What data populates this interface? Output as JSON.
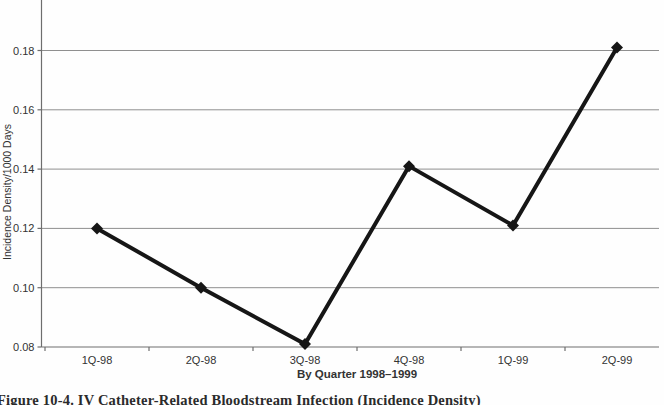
{
  "page": {
    "background": "#fefefe",
    "caption": "Figure 10-4. IV Catheter-Related Bloodstream Infection (Incidence Density)"
  },
  "chart_data": {
    "type": "line",
    "title": "",
    "categories": [
      "1Q-98",
      "2Q-98",
      "3Q-98",
      "4Q-98",
      "1Q-99",
      "2Q-99"
    ],
    "values": [
      0.12,
      0.1,
      0.081,
      0.141,
      0.121,
      0.181
    ],
    "xlabel": "By Quarter 1998–1999",
    "ylabel": "Incidence Density/1000 Days",
    "yticks": [
      0.08,
      0.1,
      0.12,
      0.14,
      0.16,
      0.18
    ],
    "ylim": [
      0.08,
      0.197
    ],
    "grid": "horizontal",
    "legend": "none",
    "marker": "diamond",
    "line_color": "#161616",
    "marker_color": "#161616",
    "grid_color": "#8f8f8f",
    "axis_color": "#6e6e6e",
    "text_color": "#333333"
  }
}
